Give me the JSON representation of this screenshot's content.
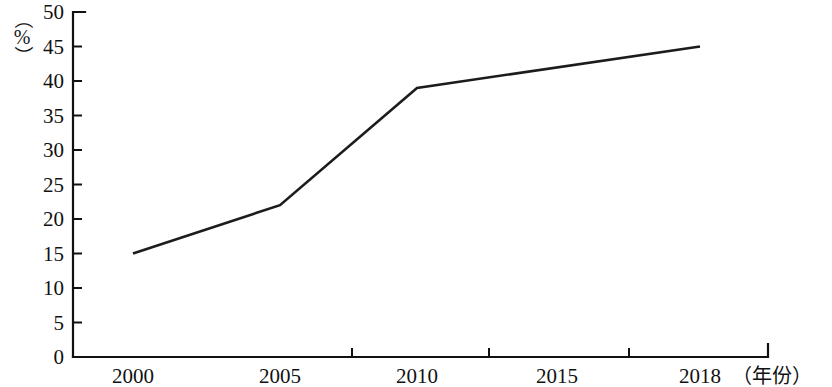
{
  "chart_data": {
    "type": "line",
    "title": "",
    "subtitle": "",
    "xlabel": "（年份）",
    "ylabel": "（%）",
    "y_unit": "%",
    "x": [
      2000,
      2005,
      2010,
      2018
    ],
    "values": [
      15,
      22,
      39,
      45
    ],
    "series": [
      {
        "name": "",
        "x": [
          2000,
          2005,
          2010,
          2018
        ],
        "values": [
          15,
          22,
          39,
          45
        ],
        "color": "#1c1c1c"
      }
    ],
    "xlim": [
      2000,
      2018
    ],
    "ylim": [
      0,
      50
    ],
    "y_ticks": [
      0,
      5,
      10,
      15,
      20,
      25,
      30,
      35,
      40,
      45,
      50
    ],
    "y_tick_labels": [
      "0",
      "5",
      "10",
      "15",
      "20",
      "25",
      "30",
      "35",
      "40",
      "45",
      "50"
    ],
    "x_ticks": [
      2000,
      2005,
      2010,
      2015,
      2018
    ],
    "x_tick_labels": [
      "2000",
      "2005",
      "2010",
      "2015",
      "2018"
    ],
    "grid": false,
    "legend": false,
    "legend_position": "none",
    "annotations": []
  },
  "axes": {
    "y_axis_unit_open_paren": "（",
    "y_axis_unit_close_paren": "）",
    "y_axis_unit_symbol": "%",
    "x_axis_caption": "（年份）"
  },
  "colors": {
    "background": "#ffffff",
    "axis": "#111111",
    "text": "#111111",
    "series": "#1c1c1c"
  }
}
